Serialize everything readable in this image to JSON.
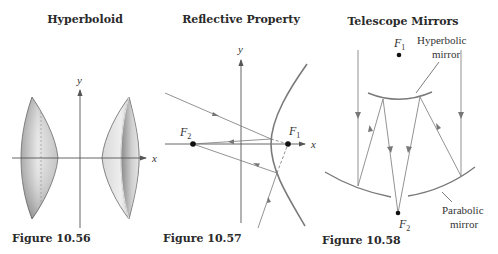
{
  "figures": [
    {
      "title": "Hyperboloid",
      "caption": "Figure 10.56",
      "axes": {
        "x_label": "x",
        "y_label": "y"
      }
    },
    {
      "title": "Reflective Property",
      "caption": "Figure 10.57",
      "axes": {
        "x_label": "x",
        "y_label": "y"
      },
      "foci": [
        {
          "name": "F",
          "sub": "1"
        },
        {
          "name": "F",
          "sub": "2"
        }
      ]
    },
    {
      "title": "Telescope Mirrors",
      "caption": "Figure 10.58",
      "foci": [
        {
          "name": "F",
          "sub": "1"
        },
        {
          "name": "F",
          "sub": "2"
        }
      ],
      "labels": {
        "hyperbolic_line1": "Hyperbolic",
        "hyperbolic_line2": "mirror",
        "parabolic_line1": "Parabolic",
        "parabolic_line2": "mirror"
      }
    }
  ],
  "colors": {
    "axis": "#555555",
    "curve": "#7a7a7a",
    "ray": "#6e6e6e",
    "text": "#2a2a2a",
    "surface_light": "#e6e6e6",
    "surface_dark": "#8f8f8f"
  }
}
